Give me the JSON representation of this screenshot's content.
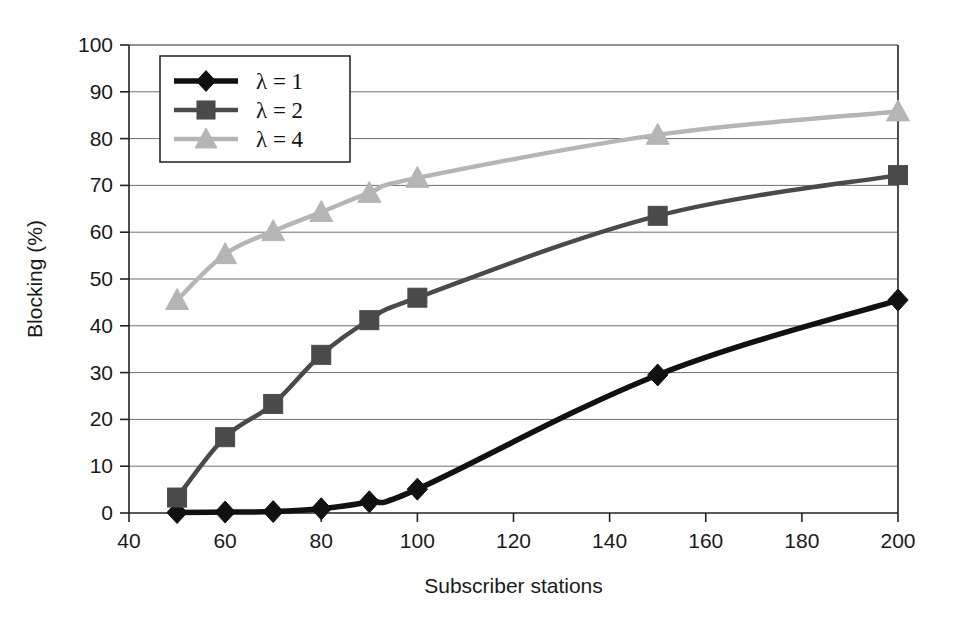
{
  "chart_data": {
    "type": "line",
    "title": "",
    "xlabel": "Subscriber stations",
    "ylabel": "Blocking (%)",
    "xlim": [
      40,
      200
    ],
    "ylim": [
      0,
      100
    ],
    "xticks": [
      40,
      60,
      80,
      100,
      120,
      140,
      160,
      180,
      200
    ],
    "yticks": [
      0,
      10,
      20,
      30,
      40,
      50,
      60,
      70,
      80,
      90,
      100
    ],
    "grid": "horizontal",
    "legend_position": "upper-left-inside",
    "x": [
      50,
      60,
      70,
      80,
      90,
      100,
      150,
      200
    ],
    "series": [
      {
        "name": "λ = 1",
        "marker": "diamond",
        "color": "#111111",
        "values": [
          0.1,
          0.2,
          0.3,
          0.9,
          2.4,
          5.1,
          29.5,
          45.5
        ]
      },
      {
        "name": "λ = 2",
        "marker": "square",
        "color": "#4a4a4a",
        "values": [
          3.3,
          16.2,
          23.3,
          33.8,
          41.2,
          46.0,
          63.5,
          72.2
        ]
      },
      {
        "name": "λ = 4",
        "marker": "triangle",
        "color": "#b5b5b5",
        "values": [
          45.5,
          55.3,
          60.2,
          64.3,
          68.4,
          71.6,
          80.8,
          85.8
        ]
      }
    ]
  },
  "axes": {
    "x_tick_labels": [
      "40",
      "60",
      "80",
      "100",
      "120",
      "140",
      "160",
      "180",
      "200"
    ],
    "y_tick_labels": [
      "0",
      "10",
      "20",
      "30",
      "40",
      "50",
      "60",
      "70",
      "80",
      "90",
      "100"
    ],
    "x_axis_title": "Subscriber stations",
    "y_axis_title": "Blocking (%)"
  },
  "legend": {
    "entries": [
      {
        "label": "λ = 1",
        "marker": "diamond-marker",
        "color": "#111111"
      },
      {
        "label": "λ = 2",
        "marker": "square-marker",
        "color": "#4a4a4a"
      },
      {
        "label": "λ = 4",
        "marker": "triangle-marker",
        "color": "#b5b5b5"
      }
    ]
  }
}
